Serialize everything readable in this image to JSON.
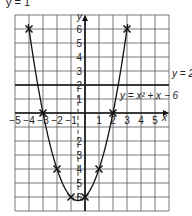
{
  "header": {
    "partial_title": "y = 1"
  },
  "chart_data": {
    "type": "line",
    "title": "",
    "xlabel": "x",
    "ylabel": "y",
    "xlim": [
      -5,
      6
    ],
    "ylim": [
      -7,
      7
    ],
    "x_ticks": [
      -5,
      -4,
      -3,
      -2,
      -1,
      1,
      2,
      3,
      4,
      5
    ],
    "y_ticks": [
      6,
      5,
      4,
      3,
      2,
      1,
      -2,
      -3,
      -4,
      -5,
      -6
    ],
    "grid": true,
    "series": [
      {
        "name": "y = x² + x − 6",
        "kind": "curve",
        "equation": "y = x^2 + x - 6",
        "points": [
          [
            -4,
            6
          ],
          [
            -3,
            0
          ],
          [
            -2,
            -4
          ],
          [
            -1,
            -6
          ],
          [
            0,
            -6
          ],
          [
            1,
            -4
          ],
          [
            2,
            0
          ],
          [
            3,
            6
          ]
        ]
      },
      {
        "name": "y = 2",
        "kind": "hline",
        "y": 2
      }
    ],
    "annotations": [
      {
        "text": "y = 2",
        "near": [
          5.5,
          2
        ]
      },
      {
        "text": "y = x² + x − 6",
        "near": [
          2.8,
          1.2
        ]
      }
    ]
  },
  "labels": {
    "curve_label": "y = x² + x − 6",
    "line_label": "y = 2",
    "x_axis": "x",
    "y_axis": "y"
  }
}
